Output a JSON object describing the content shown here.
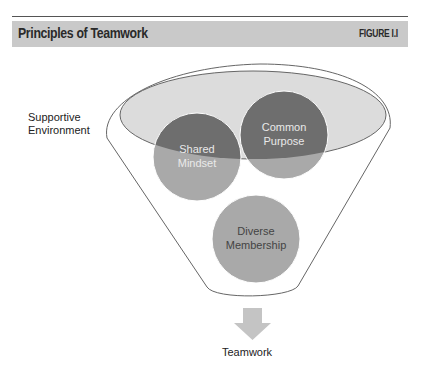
{
  "header": {
    "title": "Principles of Teamwork",
    "figure_label": "FIGURE I.I"
  },
  "diagram": {
    "environment_label_line1": "Supportive",
    "environment_label_line2": "Environment",
    "circles": [
      {
        "line1": "Shared",
        "line2": "Mindset"
      },
      {
        "line1": "Common",
        "line2": "Purpose"
      },
      {
        "line1": "Diverse",
        "line2": "Membership"
      }
    ],
    "output_label": "Teamwork",
    "colors": {
      "header_band": "#c9c9c9",
      "ellipse_fill": "#dcdcdc",
      "circle_dark": "#6e6e6e",
      "circle_light": "#a9a9a9",
      "arrow": "#c4c4c4",
      "outline": "#666666"
    }
  }
}
